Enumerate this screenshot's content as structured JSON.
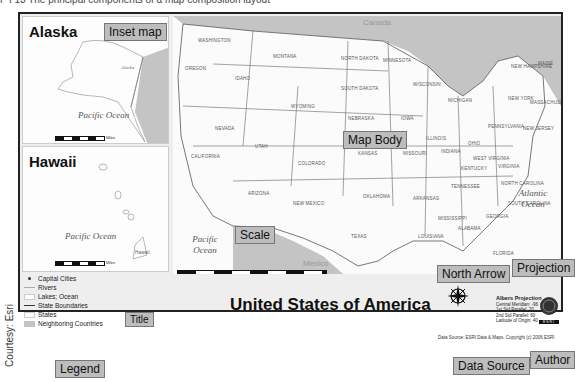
{
  "caption": "F I 13  The principal components of a map composition layout",
  "courtesy": "Courtesy: Esri",
  "insets": {
    "alaska": {
      "title": "Alaska",
      "ocean": "Pacific Ocean",
      "place": "Alaska",
      "scale_ticks": [
        "0",
        "75",
        "150",
        "300",
        "450",
        "600"
      ],
      "scale_unit": "Miles"
    },
    "hawaii": {
      "title": "Hawaii",
      "ocean": "Pacific Ocean",
      "place": "Hawaii",
      "scale_ticks": [
        "0",
        "25",
        "50",
        "100",
        "150"
      ],
      "scale_unit": "Miles"
    }
  },
  "main_map": {
    "countries": {
      "north": "Canada",
      "south": "Mexico"
    },
    "oceans": {
      "pacific": "Pacific Ocean",
      "atlantic": "Atlantic Ocean"
    },
    "states": [
      "WASHINGTON",
      "OREGON",
      "IDAHO",
      "MONTANA",
      "WYOMING",
      "NORTH DAKOTA",
      "SOUTH DAKOTA",
      "NEBRASKA",
      "MINNESOTA",
      "WISCONSIN",
      "IOWA",
      "ILLINOIS",
      "MICHIGAN",
      "NEVADA",
      "CALIFORNIA",
      "UTAH",
      "COLORADO",
      "KANSAS",
      "MISSOURI",
      "ARIZONA",
      "NEW MEXICO",
      "OKLAHOMA",
      "TEXAS",
      "ARKANSAS",
      "LOUISIANA",
      "MISSISSIPPI",
      "ALABAMA",
      "GEORGIA",
      "FLORIDA",
      "TENNESSEE",
      "KENTUCKY",
      "INDIANA",
      "OHIO",
      "WEST VIRGINIA",
      "VIRGINIA",
      "NORTH CAROLINA",
      "SOUTH CAROLINA",
      "PENNSYLVANIA",
      "NEW YORK",
      "NEW JERSEY",
      "MAINE",
      "NEW HAMPSHIRE",
      "MASSACHUSETTS"
    ],
    "scale_ticks": [
      "0",
      "62.5",
      "125",
      "250",
      "375",
      "500"
    ],
    "scale_unit": "Miles"
  },
  "legend": {
    "items": [
      {
        "label": "Capital Cities",
        "symbol": "dot"
      },
      {
        "label": "Rivers",
        "symbol": "thin-line"
      },
      {
        "label": "Lakes; Ocean",
        "symbol": "white-box"
      },
      {
        "label": "State Boundaries",
        "symbol": "dark-line"
      },
      {
        "label": "States",
        "symbol": "white-box"
      },
      {
        "label": "Neighboring Countries",
        "symbol": "gray-box"
      }
    ]
  },
  "title": "United States of America",
  "projection": {
    "name": "Albers Projection",
    "lines": [
      "Central Meridian: -96",
      "1st Std Parallel: 20",
      "2nd Std Parallel: 60",
      "Latitude of Origin: 40"
    ]
  },
  "north_arrow": {
    "n": "N",
    "s": "S",
    "e": "E",
    "w": "W"
  },
  "author_logo": "ESRI",
  "data_source": "Data Source: ESRI Data & Maps. Copyright (c) 2006 ESRI",
  "callouts": {
    "inset_map": "Inset map",
    "map_body": "Map Body",
    "scale": "Scale",
    "north_arrow": "North Arrow",
    "projection": "Projection",
    "title": "Title",
    "legend": "Legend",
    "data_source": "Data Source",
    "author": "Author"
  },
  "colors": {
    "callout_bg": "#bdbdbd",
    "neighbor_gray": "#c4c4c4",
    "frame": "#222222",
    "layout_bg": "#eeeeee"
  }
}
